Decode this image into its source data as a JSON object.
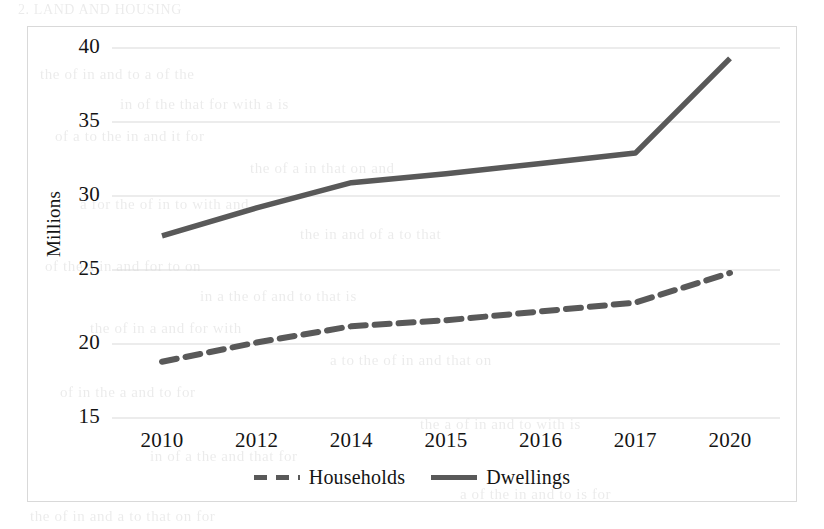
{
  "chart_data": {
    "type": "line",
    "title": "",
    "subtitle": "",
    "xlabel": "",
    "ylabel": "Millions",
    "categories": [
      "2010",
      "2012",
      "2014",
      "2015",
      "2016",
      "2017",
      "2020"
    ],
    "series": [
      {
        "name": "Households",
        "style": "dashed",
        "color": "#595959",
        "values": [
          18.8,
          20.1,
          21.2,
          21.6,
          22.2,
          22.8,
          24.8
        ]
      },
      {
        "name": "Dwellings",
        "style": "solid",
        "color": "#595959",
        "values": [
          27.3,
          29.2,
          30.9,
          31.5,
          32.2,
          32.9,
          39.3
        ]
      }
    ],
    "ylim": [
      15,
      40
    ],
    "yticks": [
      15,
      20,
      25,
      30,
      35,
      40
    ],
    "ytick_labels": [
      "15",
      "20",
      "25",
      "30",
      "35",
      "40"
    ],
    "grid": "horizontal",
    "legend_position": "bottom",
    "plot_border_color": "#d9d9d9",
    "gridline_color": "#d9d9d9",
    "background_color": "#ffffff"
  },
  "legend": {
    "items": [
      {
        "label": "Households",
        "style": "dashed"
      },
      {
        "label": "Dwellings",
        "style": "solid"
      }
    ]
  },
  "background_ghost_text": [
    {
      "text": "2. LAND AND HOUSING",
      "x": 18,
      "y": 2,
      "size": 14
    },
    {
      "text": "the  of  in  and  to  a  of  the",
      "x": 40,
      "y": 66,
      "size": 15
    },
    {
      "text": "in  of  the  that  for  with  a  is",
      "x": 120,
      "y": 96,
      "size": 15
    },
    {
      "text": "of  a  to  the  in  and  it  for",
      "x": 55,
      "y": 128,
      "size": 15
    },
    {
      "text": "the  of  a  in  that  on  and",
      "x": 250,
      "y": 160,
      "size": 15
    },
    {
      "text": "a  for  the  of  in  to  with  and",
      "x": 80,
      "y": 196,
      "size": 15
    },
    {
      "text": "the  in  and  of  a  to  that",
      "x": 300,
      "y": 226,
      "size": 15
    },
    {
      "text": "of  the  a  in  and  for  to  on",
      "x": 45,
      "y": 258,
      "size": 15
    },
    {
      "text": "in  a  the  of  and  to  that  is",
      "x": 200,
      "y": 288,
      "size": 15
    },
    {
      "text": "the  of  in  a  and  for  with",
      "x": 90,
      "y": 320,
      "size": 15
    },
    {
      "text": "a  to  the  of  in  and  that  on",
      "x": 330,
      "y": 352,
      "size": 15
    },
    {
      "text": "of  in  the  a  and  to  for",
      "x": 60,
      "y": 384,
      "size": 15
    },
    {
      "text": "the  a  of  in  and  to  with  is",
      "x": 420,
      "y": 416,
      "size": 15
    },
    {
      "text": "in  of  a  the  and  that  for",
      "x": 150,
      "y": 448,
      "size": 15
    },
    {
      "text": "the  of  in  and  a  to  that  on  for",
      "x": 30,
      "y": 508,
      "size": 15
    },
    {
      "text": "a  of  the  in  and  to  is  for",
      "x": 460,
      "y": 486,
      "size": 15
    }
  ]
}
